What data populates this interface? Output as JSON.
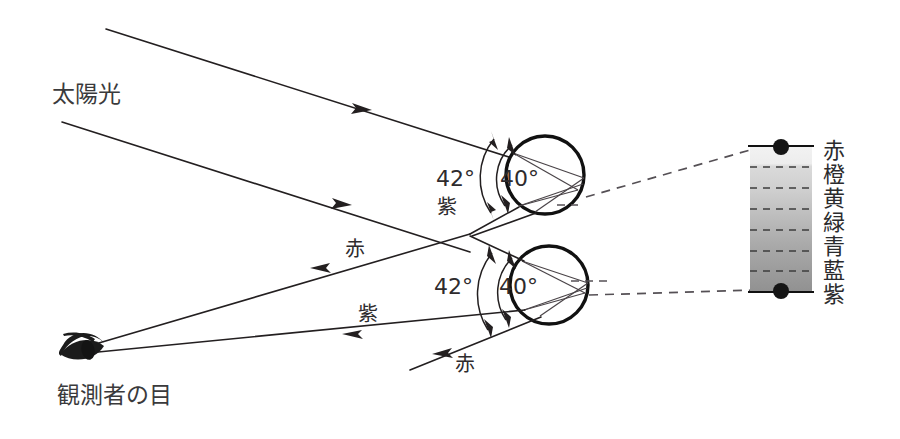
{
  "figure": {
    "title_hidden": "",
    "background_color": "#ffffff",
    "ink_color": "#231f20"
  },
  "labels": {
    "sunlight": "太陽光",
    "observer_eye": "観測者の目",
    "red_upper_ray": "赤",
    "violet_upper_ray": "紫",
    "red_lower_ray": "赤",
    "violet_lower_ray": "紫"
  },
  "angles": {
    "upper": {
      "outer": "42°",
      "inner": "40°",
      "outer_color_label": "紫"
    },
    "lower": {
      "outer": "42°",
      "inner": "40°",
      "lower_color_label": "赤"
    }
  },
  "spectrum": {
    "bands": [
      {
        "name": "赤",
        "shade": "#f0f0f0"
      },
      {
        "name": "橙",
        "shade": "#d8d8d8"
      },
      {
        "name": "黄",
        "shade": "#c9c9c9"
      },
      {
        "name": "緑",
        "shade": "#b9b9b9"
      },
      {
        "name": "青",
        "shade": "#aaaaaa"
      },
      {
        "name": "藍",
        "shade": "#9c9c9c"
      },
      {
        "name": "紫",
        "shade": "#8f8f8f"
      }
    ],
    "top_marker": "dot",
    "bottom_marker": "dot"
  },
  "drops": {
    "upper": {
      "label": "raindrop-upper"
    },
    "lower": {
      "label": "raindrop-lower"
    }
  }
}
